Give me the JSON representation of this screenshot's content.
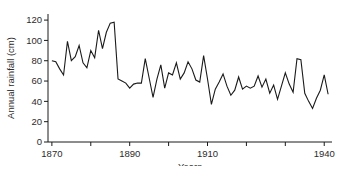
{
  "figure": {
    "background": "#ffffff",
    "line_color": "#1a1a1a",
    "axis_color": "#1a1a1a"
  },
  "chart_data": {
    "type": "line",
    "title": "",
    "xlabel": "Years",
    "ylabel": "Annual rainfall (cm)",
    "xlim": [
      1869,
      1942
    ],
    "ylim": [
      0,
      126
    ],
    "grid": false,
    "legend": "none",
    "y_ticks": [
      0,
      20,
      40,
      60,
      80,
      100,
      120
    ],
    "y_tick_labels": [
      "0",
      "20",
      "40",
      "60",
      "80",
      "100",
      "120"
    ],
    "x_ticks": [
      1870,
      1880,
      1890,
      1900,
      1910,
      1920,
      1930,
      1940
    ],
    "x_tick_labels": [
      "1870",
      "",
      "1890",
      "",
      "1910",
      "",
      "",
      "1940"
    ],
    "x": [
      1870,
      1871,
      1872,
      1873,
      1874,
      1875,
      1876,
      1877,
      1878,
      1879,
      1880,
      1881,
      1882,
      1883,
      1884,
      1885,
      1886,
      1887,
      1888,
      1889,
      1890,
      1891,
      1892,
      1893,
      1894,
      1895,
      1896,
      1897,
      1898,
      1899,
      1900,
      1901,
      1902,
      1903,
      1904,
      1905,
      1906,
      1907,
      1908,
      1909,
      1910,
      1911,
      1912,
      1913,
      1914,
      1915,
      1916,
      1917,
      1918,
      1919,
      1920,
      1921,
      1922,
      1923,
      1924,
      1925,
      1926,
      1927,
      1928,
      1929,
      1930,
      1931,
      1932,
      1933,
      1934,
      1935,
      1936,
      1937,
      1938,
      1939,
      1940,
      1941
    ],
    "values": [
      80,
      79,
      72,
      66,
      99,
      80,
      84,
      95,
      78,
      73,
      90,
      83,
      110,
      92,
      108,
      117,
      118,
      62,
      60,
      58,
      53,
      57,
      58,
      58,
      82,
      63,
      44,
      62,
      76,
      53,
      68,
      66,
      78,
      62,
      68,
      79,
      72,
      61,
      59,
      85,
      62,
      37,
      52,
      59,
      67,
      55,
      46,
      51,
      64,
      52,
      55,
      53,
      55,
      65,
      54,
      62,
      48,
      56,
      42,
      55,
      68,
      57,
      49,
      82,
      81,
      48,
      40,
      33,
      43,
      51,
      66,
      47
    ],
    "series": [
      {
        "name": "Annual rainfall",
        "unit": "cm",
        "values": [
          80,
          79,
          72,
          66,
          99,
          80,
          84,
          95,
          78,
          73,
          90,
          83,
          110,
          92,
          108,
          117,
          118,
          62,
          60,
          58,
          53,
          57,
          58,
          58,
          82,
          63,
          44,
          62,
          76,
          53,
          68,
          66,
          78,
          62,
          68,
          79,
          72,
          61,
          59,
          85,
          62,
          37,
          52,
          59,
          67,
          55,
          46,
          51,
          64,
          52,
          55,
          53,
          55,
          65,
          54,
          62,
          48,
          56,
          42,
          55,
          68,
          57,
          49,
          82,
          81,
          48,
          40,
          33,
          43,
          51,
          66,
          47
        ]
      }
    ]
  }
}
